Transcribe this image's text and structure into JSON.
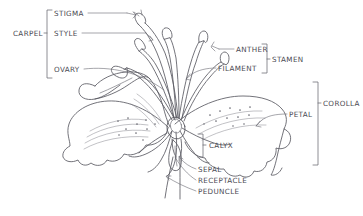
{
  "figure": {
    "style": "hand-drawn pencil sketch",
    "background_color": "#ffffff",
    "ink_color": "#55555d"
  },
  "labels": {
    "carpel": "CARPEL",
    "stigma": "STIGMA",
    "style": "STYLE",
    "ovary": "OVARY",
    "anther": "ANTHER",
    "filament": "FILAMENT",
    "stamen": "STAMEN",
    "corolla": "COROLLA",
    "petal": "PETAL",
    "calyx": "CALYX",
    "sepal": "SEPAL",
    "receptacle": "RECEPTACLE",
    "peduncle": "PEDUNCLE"
  },
  "groups": [
    {
      "name": "carpel",
      "label": "CARPEL",
      "side": "left",
      "members": [
        "STIGMA",
        "STYLE",
        "OVARY"
      ]
    },
    {
      "name": "stamen",
      "label": "STAMEN",
      "side": "right",
      "members": [
        "ANTHER",
        "FILAMENT"
      ]
    },
    {
      "name": "corolla",
      "label": "COROLLA",
      "side": "right",
      "members": [
        "PETAL"
      ]
    },
    {
      "name": "calyx",
      "label": "CALYX",
      "side": "center-right",
      "members": [
        "SEPAL"
      ]
    }
  ],
  "leader_labels": [
    {
      "text": "STIGMA",
      "x": 55,
      "y": 14
    },
    {
      "text": "STYLE",
      "x": 55,
      "y": 32
    },
    {
      "text": "OVARY",
      "x": 56,
      "y": 70
    },
    {
      "text": "CARPEL",
      "x": 13,
      "y": 33
    },
    {
      "text": "ANTHER",
      "x": 222,
      "y": 49
    },
    {
      "text": "FILAMENT",
      "x": 219,
      "y": 68
    },
    {
      "text": "STAMEN",
      "x": 272,
      "y": 59
    },
    {
      "text": "COROLLA",
      "x": 324,
      "y": 103
    },
    {
      "text": "PETAL",
      "x": 290,
      "y": 115
    },
    {
      "text": "CALYX",
      "x": 208,
      "y": 145
    },
    {
      "text": "SEPAL",
      "x": 198,
      "y": 170
    },
    {
      "text": "RECEPTACLE",
      "x": 198,
      "y": 181
    },
    {
      "text": "PEDUNCLE",
      "x": 198,
      "y": 192
    }
  ]
}
